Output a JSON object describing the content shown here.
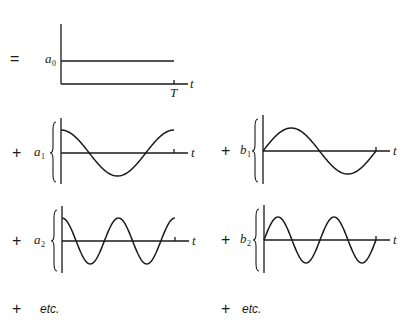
{
  "diagram": {
    "period_label": "T",
    "time_label": "t",
    "equals_sign": "=",
    "plus_sign": "+",
    "etc_label": "etc.",
    "terms": [
      {
        "id": "a0",
        "coef": "a",
        "sub": "0",
        "kind": "constant",
        "harmonic": 0
      },
      {
        "id": "a1",
        "coef": "a",
        "sub": "1",
        "kind": "cosine",
        "harmonic": 1
      },
      {
        "id": "b1",
        "coef": "b",
        "sub": "1",
        "kind": "sine",
        "harmonic": 1
      },
      {
        "id": "a2",
        "coef": "a",
        "sub": "2",
        "kind": "cosine",
        "harmonic": 2
      },
      {
        "id": "b2",
        "coef": "b",
        "sub": "2",
        "kind": "sine",
        "harmonic": 2
      }
    ]
  }
}
